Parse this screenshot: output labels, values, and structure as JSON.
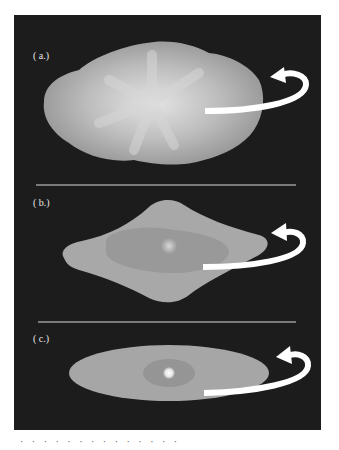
{
  "figure": {
    "panels": [
      {
        "label": "( a.)",
        "description": "irregular clumpy cloud with rotation arrow"
      },
      {
        "label": "( b.)",
        "description": "flattened rhombus-shaped cloud with central core and rotation arrow"
      },
      {
        "label": "( c.)",
        "description": "thin elliptical disk with bright central core and rotation arrow"
      }
    ],
    "colors": {
      "background": "#1c1c1c",
      "divider": "#d8d8d8",
      "cloud": "#a8a8a8",
      "arrow": "#ffffff"
    },
    "caption_partial": "· · · · · · · · · · · · · ·"
  }
}
